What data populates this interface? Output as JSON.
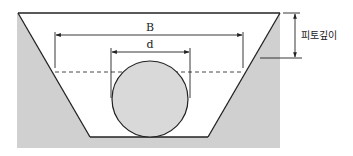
{
  "diagram": {
    "labels": {
      "trench_width": "B",
      "pipe_diameter": "d",
      "cover_depth": "피토깊이"
    },
    "colors": {
      "soil": "#d0d0d0",
      "trench": "#ffffff",
      "pipe_fill": "#d9d9d9",
      "line": "#222222"
    },
    "elements": [
      {
        "id": "soil",
        "shape": "rectangle",
        "description": "Surrounding ground (gray)"
      },
      {
        "id": "trench",
        "shape": "trapezoid",
        "description": "Excavated trench, wide at top, narrow at bottom"
      },
      {
        "id": "pipe",
        "shape": "circle",
        "description": "Circular pipe resting on trench bottom"
      },
      {
        "id": "dashed-line",
        "shape": "dashed horizontal line",
        "description": "Level of trench width B measurement"
      },
      {
        "id": "dim-B",
        "shape": "dimension",
        "label": "B"
      },
      {
        "id": "dim-d",
        "shape": "dimension",
        "label": "d"
      },
      {
        "id": "dim-depth",
        "shape": "dimension",
        "label": "피토깊이"
      }
    ]
  }
}
